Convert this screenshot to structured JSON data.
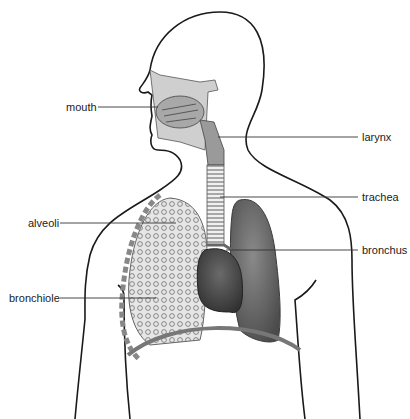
{
  "diagram": {
    "labels": [
      {
        "id": "mouth",
        "text": "mouth",
        "side": "left",
        "x": 66,
        "y": 101
      },
      {
        "id": "larynx",
        "text": "larynx",
        "side": "right",
        "x": 362,
        "y": 131
      },
      {
        "id": "trachea",
        "text": "trachea",
        "side": "right",
        "x": 362,
        "y": 192
      },
      {
        "id": "alveoli",
        "text": "alveoli",
        "side": "left",
        "x": 28,
        "y": 218
      },
      {
        "id": "bronchus",
        "text": "bronchus",
        "side": "right",
        "x": 362,
        "y": 245
      },
      {
        "id": "bronchiole",
        "text": "bronchiole",
        "side": "left",
        "x": 9,
        "y": 293
      }
    ],
    "colors": {
      "outline": "#1a1a1a",
      "lung_dark": "#5a5a5a",
      "lung_light": "#d8d8d8",
      "leader_line": "#333333"
    }
  }
}
